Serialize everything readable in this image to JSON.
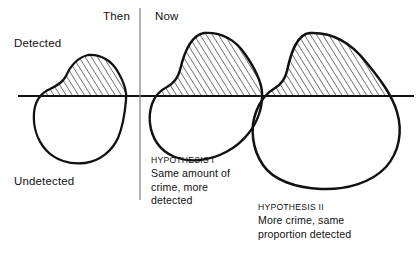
{
  "figure": {
    "title_implied": "Detected versus undetected crime, Then and Now",
    "baseline_label_top": "Detected",
    "baseline_label_bottom": "Undetected",
    "periods": [
      {
        "label": "Then",
        "x": 103,
        "y": 11
      },
      {
        "label": "Now",
        "x": 155,
        "y": 11
      }
    ],
    "axis_labels": [
      {
        "name": "detected",
        "text": "Detected",
        "x": 14,
        "y": 38
      },
      {
        "name": "undetected",
        "text": "Undetected",
        "x": 14,
        "y": 176
      }
    ],
    "hypotheses": [
      {
        "id": "hypothesis-1",
        "heading": "HYPOTHESIS I",
        "lines": [
          "Same amount of",
          "crime, more",
          "detected"
        ],
        "x": 151,
        "y": 155
      },
      {
        "id": "hypothesis-2",
        "heading": "HYPOTHESIS II",
        "lines": [
          "More crime, same",
          "proportion detected"
        ],
        "x": 258,
        "y": 202
      }
    ],
    "colors": {
      "ink": "#111111",
      "divider": "#777777",
      "background": "#ffffff",
      "hatch": "#111111"
    },
    "baseline": {
      "y": 96,
      "x_start": 18,
      "x_end": 414,
      "width": 1.6
    },
    "divider": {
      "x": 140,
      "y_start": 8,
      "y_end": 200,
      "width": 1.1
    },
    "blobs": [
      {
        "name": "blob-then",
        "period": "Then",
        "detected_hatched": true,
        "peak_y": 55,
        "bottom_y": 163,
        "left_x": 33,
        "right_x": 126
      },
      {
        "name": "blob-now-hypothesis-1",
        "period": "Now",
        "detected_hatched": true,
        "peak_y": 33,
        "bottom_y": 160,
        "left_x": 160,
        "right_x": 262
      },
      {
        "name": "blob-now-hypothesis-2",
        "period": "Now",
        "detected_hatched": true,
        "peak_y": 33,
        "bottom_y": 189,
        "left_x": 258,
        "right_x": 400
      }
    ]
  }
}
